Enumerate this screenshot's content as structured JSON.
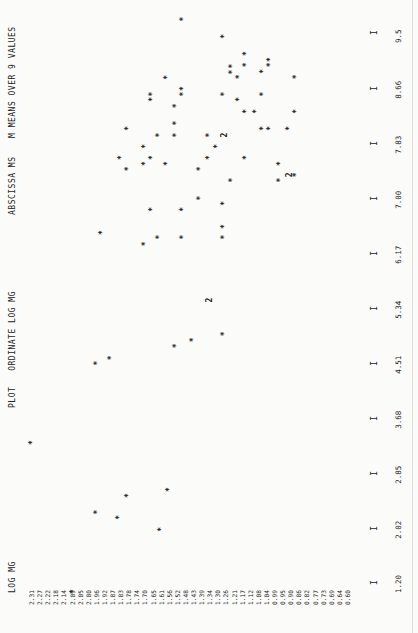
{
  "header": {
    "y_title": "LOG MG",
    "plot_title": "PLOT   ORDINATE LOG MG",
    "abscissa_title": "ABSCISSA MS",
    "note": "M MEANS OVER 9 VALUES"
  },
  "y_ticks": [
    "2.31",
    "2.27",
    "2.22",
    "2.18",
    "2.14",
    "2.09",
    "2.05",
    "2.00",
    "1.96",
    "1.92",
    "1.87",
    "1.83",
    "1.78",
    "1.74",
    "1.70",
    "1.65",
    "1.61",
    "1.56",
    "1.52",
    "1.48",
    "1.43",
    "1.39",
    "1.34",
    "1.30",
    "1.26",
    "1.21",
    "1.17",
    "1.12",
    "1.08",
    "1.04",
    "0.99",
    "0.95",
    "0.90",
    "0.86",
    "0.82",
    "0.77",
    "0.73",
    "0.69",
    "0.64",
    "0.60"
  ],
  "x_ticks": [
    "1.20",
    "2.02",
    "2.85",
    "3.68",
    "4.51",
    "5.34",
    "6.17",
    "7.00",
    "7.83",
    "8.66",
    "9.5"
  ],
  "x_tick_mark": "I",
  "chart_data": {
    "type": "scatter",
    "xlabel": "MS",
    "ylabel": "LOG MG",
    "xlim": [
      1.2,
      9.5
    ],
    "ylim": [
      0.6,
      2.31
    ],
    "x_ticks": [
      1.2,
      2.02,
      2.85,
      3.68,
      4.51,
      5.34,
      6.17,
      7.0,
      7.83,
      8.66,
      9.5
    ],
    "grid": false,
    "annotations": [
      "M MEANS OVER 9 VALUES",
      "2 = two coincident points"
    ],
    "orientation": "rotated 90 degrees counter-clockwise on page",
    "points": [
      {
        "x": 1.07,
        "y": 2.09,
        "n": 1
      },
      {
        "x": 2.01,
        "y": 1.61,
        "n": 1
      },
      {
        "x": 2.19,
        "y": 1.84,
        "n": 1
      },
      {
        "x": 2.27,
        "y": 1.96,
        "n": 1
      },
      {
        "x": 2.52,
        "y": 1.79,
        "n": 1
      },
      {
        "x": 2.61,
        "y": 1.57,
        "n": 1
      },
      {
        "x": 3.32,
        "y": 2.31,
        "n": 1
      },
      {
        "x": 4.52,
        "y": 1.96,
        "n": 1
      },
      {
        "x": 4.6,
        "y": 1.88,
        "n": 1
      },
      {
        "x": 4.78,
        "y": 1.53,
        "n": 1
      },
      {
        "x": 4.87,
        "y": 1.44,
        "n": 1
      },
      {
        "x": 4.96,
        "y": 1.27,
        "n": 1
      },
      {
        "x": 5.47,
        "y": 1.35,
        "n": 2
      },
      {
        "x": 6.32,
        "y": 1.7,
        "n": 1
      },
      {
        "x": 6.42,
        "y": 1.62,
        "n": 1
      },
      {
        "x": 6.42,
        "y": 1.49,
        "n": 1
      },
      {
        "x": 6.42,
        "y": 1.27,
        "n": 1
      },
      {
        "x": 6.49,
        "y": 1.93,
        "n": 1
      },
      {
        "x": 6.58,
        "y": 1.27,
        "n": 1
      },
      {
        "x": 6.84,
        "y": 1.66,
        "n": 1
      },
      {
        "x": 6.84,
        "y": 1.49,
        "n": 1
      },
      {
        "x": 6.93,
        "y": 1.27,
        "n": 1
      },
      {
        "x": 7.01,
        "y": 1.4,
        "n": 1
      },
      {
        "x": 7.28,
        "y": 1.23,
        "n": 1
      },
      {
        "x": 7.28,
        "y": 0.97,
        "n": 1
      },
      {
        "x": 7.36,
        "y": 0.92,
        "n": 2
      },
      {
        "x": 7.36,
        "y": 0.88,
        "n": 1
      },
      {
        "x": 7.45,
        "y": 1.79,
        "n": 1
      },
      {
        "x": 7.45,
        "y": 1.4,
        "n": 1
      },
      {
        "x": 7.53,
        "y": 0.97,
        "n": 1
      },
      {
        "x": 7.53,
        "y": 1.7,
        "n": 1
      },
      {
        "x": 7.53,
        "y": 1.58,
        "n": 1
      },
      {
        "x": 7.62,
        "y": 1.83,
        "n": 1
      },
      {
        "x": 7.62,
        "y": 1.66,
        "n": 1
      },
      {
        "x": 7.62,
        "y": 1.35,
        "n": 1
      },
      {
        "x": 7.62,
        "y": 1.15,
        "n": 1
      },
      {
        "x": 7.79,
        "y": 1.7,
        "n": 1
      },
      {
        "x": 7.79,
        "y": 1.31,
        "n": 1
      },
      {
        "x": 7.96,
        "y": 1.62,
        "n": 1
      },
      {
        "x": 7.96,
        "y": 1.53,
        "n": 1
      },
      {
        "x": 7.96,
        "y": 1.35,
        "n": 1
      },
      {
        "x": 7.96,
        "y": 1.27,
        "n": 2
      },
      {
        "x": 8.06,
        "y": 1.79,
        "n": 1
      },
      {
        "x": 8.06,
        "y": 1.06,
        "n": 1
      },
      {
        "x": 8.06,
        "y": 1.02,
        "n": 1
      },
      {
        "x": 8.06,
        "y": 0.92,
        "n": 1
      },
      {
        "x": 8.14,
        "y": 1.53,
        "n": 1
      },
      {
        "x": 8.32,
        "y": 1.15,
        "n": 1
      },
      {
        "x": 8.32,
        "y": 1.1,
        "n": 1
      },
      {
        "x": 8.32,
        "y": 0.88,
        "n": 1
      },
      {
        "x": 8.4,
        "y": 1.53,
        "n": 1
      },
      {
        "x": 8.5,
        "y": 1.66,
        "n": 1
      },
      {
        "x": 8.5,
        "y": 1.19,
        "n": 1
      },
      {
        "x": 8.58,
        "y": 1.66,
        "n": 1
      },
      {
        "x": 8.58,
        "y": 1.49,
        "n": 1
      },
      {
        "x": 8.58,
        "y": 1.27,
        "n": 1
      },
      {
        "x": 8.58,
        "y": 1.06,
        "n": 1
      },
      {
        "x": 8.66,
        "y": 1.49,
        "n": 1
      },
      {
        "x": 8.83,
        "y": 1.58,
        "n": 1
      },
      {
        "x": 8.84,
        "y": 1.19,
        "n": 1
      },
      {
        "x": 8.84,
        "y": 0.88,
        "n": 1
      },
      {
        "x": 8.91,
        "y": 1.23,
        "n": 1
      },
      {
        "x": 8.92,
        "y": 1.06,
        "n": 1
      },
      {
        "x": 9.0,
        "y": 1.23,
        "n": 1
      },
      {
        "x": 9.02,
        "y": 1.15,
        "n": 1
      },
      {
        "x": 9.02,
        "y": 1.02,
        "n": 1
      },
      {
        "x": 9.1,
        "y": 1.02,
        "n": 1
      },
      {
        "x": 9.19,
        "y": 1.15,
        "n": 1
      },
      {
        "x": 9.45,
        "y": 1.27,
        "n": 1
      },
      {
        "x": 9.71,
        "y": 1.49,
        "n": 1
      }
    ]
  }
}
